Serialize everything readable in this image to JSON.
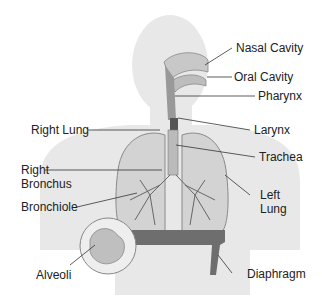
{
  "diagram": {
    "labels": {
      "nasal_cavity": "Nasal Cavity",
      "oral_cavity": "Oral Cavity",
      "pharynx": "Pharynx",
      "larynx": "Larynx",
      "trachea": "Trachea",
      "left_lung_1": "Left",
      "left_lung_2": "Lung",
      "right_lung": "Right Lung",
      "right_bronchus_1": "Right",
      "right_bronchus_2": "Bronchus",
      "bronchiole": "Bronchiole",
      "alveoli": "Alveoli",
      "diaphragm": "Diaphragm"
    },
    "colors": {
      "silhouette": "#e6e6e6",
      "lung_fill": "#d2d2d2",
      "lung_stroke": "#8a8a8a",
      "diaphragm": "#6e6e6e",
      "leader_line": "#333333"
    }
  }
}
